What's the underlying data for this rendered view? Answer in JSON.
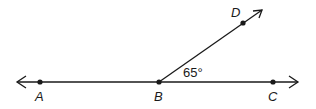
{
  "diagram": {
    "type": "geometry-angle",
    "line_color": "#1a1a1a",
    "points": {
      "A": {
        "label": "A",
        "x": 40,
        "y": 82,
        "label_x": 35,
        "label_y": 101
      },
      "B": {
        "label": "B",
        "x": 159,
        "y": 82,
        "label_x": 154,
        "label_y": 101
      },
      "C": {
        "label": "C",
        "x": 273,
        "y": 82,
        "label_x": 268,
        "label_y": 101
      },
      "D": {
        "label": "D",
        "x": 243,
        "y": 23,
        "label_x": 231,
        "label_y": 17
      }
    },
    "angle": {
      "label": "65°",
      "vertex": "B",
      "between": [
        "C",
        "D"
      ],
      "x": 183,
      "y": 77
    }
  }
}
